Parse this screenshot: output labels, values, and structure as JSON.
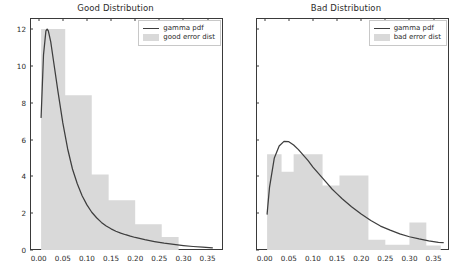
{
  "figure": {
    "width": 461,
    "height": 277,
    "background": "#ffffff",
    "line_color": "#3e3e3e",
    "patch_color": "#d9d9d9",
    "axis_color": "#3a3a3a",
    "text_color": "#2b2b2b"
  },
  "panels": [
    {
      "id": "good",
      "title": "Good Distribution",
      "legend": {
        "position": "upper right",
        "entries": [
          {
            "label": "gamma pdf",
            "type": "line",
            "color": "#3e3e3e"
          },
          {
            "label": "good error dist",
            "type": "patch",
            "color": "#d9d9d9"
          }
        ]
      },
      "yticks": [
        "0",
        "2",
        "4",
        "6",
        "8",
        "10",
        "12"
      ],
      "xticks": [
        "0.00",
        "0.05",
        "0.10",
        "0.15",
        "0.20",
        "0.25",
        "0.30",
        "0.35"
      ]
    },
    {
      "id": "bad",
      "title": "Bad Distribution",
      "legend": {
        "position": "upper right",
        "entries": [
          {
            "label": "gamma pdf",
            "type": "line",
            "color": "#3e3e3e"
          },
          {
            "label": "bad error dist",
            "type": "patch",
            "color": "#d9d9d9"
          }
        ]
      },
      "yticks": [],
      "xticks": [
        "0.00",
        "0.05",
        "0.10",
        "0.15",
        "0.20",
        "0.25",
        "0.30",
        "0.35"
      ]
    }
  ],
  "chart_data": [
    {
      "type": "bar",
      "id": "good",
      "title": "Good Distribution",
      "xlabel": "",
      "ylabel": "",
      "xlim": [
        -0.018,
        0.382
      ],
      "ylim": [
        0.0,
        12.6
      ],
      "grid": false,
      "legend_position": "upper right",
      "series": [
        {
          "name": "good error dist",
          "type": "histogram",
          "color": "#d9d9d9",
          "bin_edges": [
            0.005,
            0.055,
            0.11,
            0.145,
            0.2,
            0.255,
            0.29
          ],
          "values": [
            12.0,
            8.4,
            4.1,
            2.7,
            1.4,
            0.7
          ]
        },
        {
          "name": "gamma pdf",
          "type": "line",
          "color": "#3e3e3e",
          "x": [
            0.005,
            0.01,
            0.015,
            0.0175,
            0.02,
            0.025,
            0.03,
            0.04,
            0.05,
            0.06,
            0.07,
            0.08,
            0.09,
            0.1,
            0.11,
            0.12,
            0.13,
            0.14,
            0.15,
            0.16,
            0.17,
            0.18,
            0.19,
            0.2,
            0.22,
            0.24,
            0.26,
            0.28,
            0.3,
            0.32,
            0.34,
            0.36
          ],
          "y": [
            7.2,
            10.6,
            11.9,
            12.0,
            11.9,
            11.3,
            10.4,
            8.6,
            6.9,
            5.5,
            4.4,
            3.6,
            2.95,
            2.45,
            2.05,
            1.75,
            1.5,
            1.3,
            1.15,
            1.02,
            0.92,
            0.83,
            0.75,
            0.68,
            0.56,
            0.46,
            0.37,
            0.3,
            0.24,
            0.19,
            0.15,
            0.12
          ]
        }
      ]
    },
    {
      "type": "bar",
      "id": "bad",
      "title": "Bad Distribution",
      "xlabel": "",
      "ylabel": "",
      "xlim": [
        -0.018,
        0.382
      ],
      "ylim": [
        0.0,
        12.6
      ],
      "grid": false,
      "legend_position": "upper right",
      "series": [
        {
          "name": "bad error dist",
          "type": "histogram",
          "color": "#d9d9d9",
          "bin_edges": [
            0.005,
            0.035,
            0.06,
            0.12,
            0.155,
            0.215,
            0.25,
            0.3,
            0.335,
            0.365
          ],
          "values": [
            5.2,
            4.25,
            5.2,
            3.5,
            4.05,
            0.55,
            0.28,
            1.5,
            0.25
          ]
        },
        {
          "name": "gamma pdf",
          "type": "line",
          "color": "#3e3e3e",
          "x": [
            0.005,
            0.01,
            0.02,
            0.03,
            0.04,
            0.05,
            0.06,
            0.07,
            0.08,
            0.09,
            0.1,
            0.11,
            0.12,
            0.13,
            0.14,
            0.15,
            0.16,
            0.18,
            0.2,
            0.22,
            0.24,
            0.26,
            0.28,
            0.3,
            0.32,
            0.34,
            0.36,
            0.37
          ],
          "y": [
            1.95,
            3.4,
            5.0,
            5.65,
            5.9,
            5.88,
            5.7,
            5.45,
            5.15,
            4.85,
            4.5,
            4.2,
            3.9,
            3.6,
            3.3,
            3.05,
            2.8,
            2.35,
            1.95,
            1.6,
            1.3,
            1.08,
            0.88,
            0.72,
            0.6,
            0.5,
            0.42,
            0.4
          ]
        }
      ]
    }
  ]
}
